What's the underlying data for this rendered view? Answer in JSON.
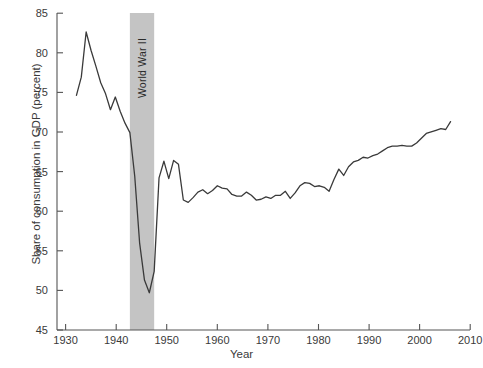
{
  "chart_data": {
    "type": "line",
    "title": "",
    "xlabel": "Year",
    "ylabel": "Share of consumption in GDP (percent)",
    "xlim": [
      1925,
      2010
    ],
    "ylim": [
      45,
      85
    ],
    "xticks": [
      1930,
      1940,
      1950,
      1960,
      1970,
      1980,
      1990,
      2000,
      2010
    ],
    "xtick_labels": [
      "1930",
      "1940",
      "1950",
      "1960",
      "1970",
      "1980",
      "1990",
      "2000",
      "2010"
    ],
    "yticks": [
      45,
      50,
      55,
      60,
      65,
      70,
      75,
      80,
      85
    ],
    "ytick_labels": [
      "45",
      "50",
      "55",
      "60",
      "65",
      "70",
      "75",
      "80",
      "85"
    ],
    "grid": false,
    "legend": null,
    "line_color": "#3a3a3a",
    "line_width": 1.3,
    "annotations": [
      {
        "name": "world-war-2-band",
        "label": "World War II",
        "type": "vspan",
        "x_start": 1940,
        "x_end": 1945,
        "color": "#c4c4c4",
        "label_orientation": "vertical"
      }
    ],
    "series": [
      {
        "name": "Share of consumption in GDP",
        "x": [
          1929,
          1930,
          1931,
          1932,
          1933,
          1934,
          1935,
          1936,
          1937,
          1938,
          1939,
          1940,
          1941,
          1942,
          1943,
          1944,
          1945,
          1946,
          1947,
          1948,
          1949,
          1950,
          1951,
          1952,
          1953,
          1954,
          1955,
          1956,
          1957,
          1958,
          1959,
          1960,
          1961,
          1962,
          1963,
          1964,
          1965,
          1966,
          1967,
          1968,
          1969,
          1970,
          1971,
          1972,
          1973,
          1974,
          1975,
          1976,
          1977,
          1978,
          1979,
          1980,
          1981,
          1982,
          1983,
          1984,
          1985,
          1986,
          1987,
          1988,
          1989,
          1990,
          1991,
          1992,
          1993,
          1994,
          1995,
          1996,
          1997,
          1998,
          1999,
          2000,
          2001,
          2002,
          2003,
          2004,
          2005,
          2006
        ],
        "y": [
          74.6,
          76.9,
          82.6,
          80.3,
          78.3,
          76.2,
          74.8,
          72.8,
          74.4,
          72.6,
          71.1,
          69.9,
          64.4,
          56.0,
          51.3,
          49.7,
          52.4,
          64.2,
          66.3,
          64.1,
          66.4,
          65.9,
          61.4,
          61.1,
          61.7,
          62.4,
          62.7,
          62.2,
          62.6,
          63.2,
          62.9,
          62.8,
          62.1,
          61.9,
          61.9,
          62.4,
          62.0,
          61.4,
          61.5,
          61.8,
          61.6,
          62.0,
          62.0,
          62.5,
          61.6,
          62.3,
          63.2,
          63.6,
          63.5,
          63.1,
          63.2,
          63.0,
          62.5,
          64.0,
          65.3,
          64.5,
          65.6,
          66.2,
          66.4,
          66.8,
          66.7,
          67.0,
          67.2,
          67.6,
          68.0,
          68.2,
          68.2,
          68.3,
          68.2,
          68.2,
          68.6,
          69.2,
          69.8,
          70.0,
          70.2,
          70.4,
          70.3,
          71.3
        ]
      }
    ]
  },
  "axes": {
    "x_tick_labels": [
      "1930",
      "1940",
      "1950",
      "1960",
      "1970",
      "1980",
      "1990",
      "2000",
      "2010"
    ],
    "y_tick_labels": [
      "45",
      "50",
      "55",
      "60",
      "65",
      "70",
      "75",
      "80",
      "85"
    ],
    "x_axis_title": "Year",
    "y_axis_title": "Share of consumption in GDP (percent)"
  },
  "annotation": {
    "ww2_label": "World War II"
  }
}
